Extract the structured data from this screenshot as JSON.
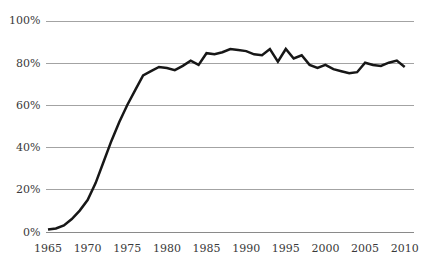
{
  "chart_data": {
    "type": "line",
    "title": "",
    "xlabel": "",
    "ylabel": "",
    "x": [
      1965,
      1966,
      1967,
      1968,
      1969,
      1970,
      1971,
      1972,
      1973,
      1974,
      1975,
      1976,
      1977,
      1978,
      1979,
      1980,
      1981,
      1982,
      1983,
      1984,
      1985,
      1986,
      1987,
      1988,
      1989,
      1990,
      1991,
      1992,
      1993,
      1994,
      1995,
      1996,
      1997,
      1998,
      1999,
      2000,
      2001,
      2002,
      2003,
      2004,
      2005,
      2006,
      2007,
      2008,
      2009,
      2010
    ],
    "series": [
      {
        "name": "percent-share",
        "color": "#171717",
        "values": [
          1,
          1.5,
          3,
          6,
          10,
          15,
          23,
          33,
          43,
          52,
          60,
          67,
          74,
          76,
          78,
          77.5,
          76.5,
          78.5,
          81,
          79,
          84.5,
          84,
          85,
          86.5,
          86,
          85.5,
          84,
          83.5,
          86.5,
          80.5,
          86.5,
          82,
          83.5,
          79,
          77.5,
          79,
          77,
          76,
          75,
          75.5,
          80,
          79,
          78.5,
          80,
          81,
          78
        ]
      }
    ],
    "xlim": [
      1965,
      2010
    ],
    "ylim": [
      0,
      100
    ],
    "x_tick_years": [
      1965,
      1970,
      1975,
      1980,
      1985,
      1990,
      1995,
      2000,
      2005,
      2010
    ],
    "x_tick_labels": [
      "1965",
      "1970",
      "1975",
      "1980",
      "1985",
      "1990",
      "1995",
      "2000",
      "2005",
      "2010"
    ],
    "y_tick_values": [
      0,
      20,
      40,
      60,
      80,
      100
    ],
    "y_tick_labels": [
      "0%",
      "20%",
      "40%",
      "60%",
      "80%",
      "100%"
    ],
    "grid": "horizontal",
    "legend": "none",
    "colors": {
      "background": "#ffffff",
      "gridline": "#a3a3a3",
      "axis_line": "#8a8a8a",
      "line": "#171717",
      "tick_text": "#3a3a3a"
    }
  }
}
